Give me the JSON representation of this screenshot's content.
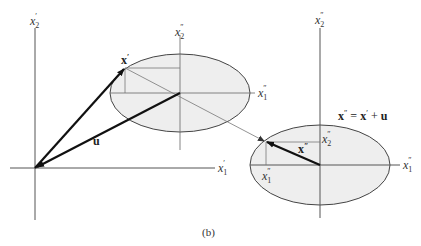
{
  "figure": {
    "caption": "(b)",
    "colors": {
      "axis": "#555555",
      "ellipse_fill": "#eeeeee",
      "ellipse_stroke": "#444444",
      "vector": "#111111",
      "thin_line": "#777777"
    },
    "primed_frame": {
      "x1_label": "x",
      "x1_sub": "1",
      "x1_sup": "′",
      "x2_label": "x",
      "x2_sub": "2",
      "x2_sup": "′"
    },
    "frame_one": {
      "x1_label": "x",
      "x1_sub": "1",
      "x1_sup": "″",
      "x2_label": "x",
      "x2_sub": "2",
      "x2_sup": "″",
      "point_label": "x",
      "point_sup": "′"
    },
    "vector_u_label": "u",
    "frame_two": {
      "x1_label": "x",
      "x1_sub": "1",
      "x1_sup": "″",
      "x2_label": "x",
      "x2_sub": "2",
      "x2_sup": "″",
      "point_label": "x",
      "point_sup": "″",
      "comp1_label": "x",
      "comp1_sub": "1",
      "comp1_sup": "″",
      "comp2_label": "x",
      "comp2_sub": "2",
      "comp2_sup": "″"
    },
    "equation": {
      "lhs": "x",
      "lhs_sup": "″",
      "eq": " = ",
      "term1": "x",
      "term1_sup": "′",
      "plus": " + ",
      "term2": "u"
    }
  }
}
